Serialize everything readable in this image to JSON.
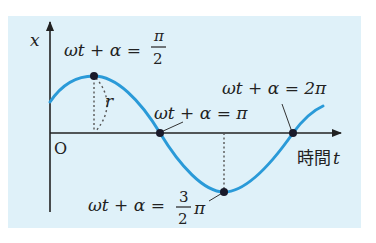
{
  "diagram": {
    "axes": {
      "y_label": "x",
      "origin_label": "O",
      "x_label_prefix": "時間",
      "x_label_var": "t"
    },
    "annotations": {
      "peak": {
        "lhs": "ωt + α =",
        "num": "π",
        "den": "2"
      },
      "zero_pi": {
        "text": "ωt + α = π"
      },
      "zero_2pi": {
        "text": "ωt + α = 2π"
      },
      "trough": {
        "lhs": "ωt + α =",
        "num": "3",
        "den": "2",
        "suffix": "π"
      },
      "radius": "r"
    },
    "colors": {
      "panel_bg": "#dff1f9",
      "curve": "#2a9ad8",
      "axis": "#222222",
      "point": "#1a1a2a"
    }
  }
}
